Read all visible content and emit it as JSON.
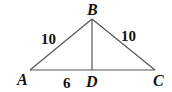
{
  "figure": {
    "type": "triangle with altitude",
    "points": {
      "A": {
        "label": "A",
        "x": 30,
        "y": 70
      },
      "B": {
        "label": "B",
        "x": 92,
        "y": 19
      },
      "C": {
        "label": "C",
        "x": 155,
        "y": 70
      },
      "D": {
        "label": "D",
        "x": 92,
        "y": 70
      }
    },
    "segments": [
      "AB",
      "BC",
      "AC",
      "BD"
    ],
    "measures": {
      "AB": "10",
      "BC": "10",
      "AD": "6"
    }
  }
}
